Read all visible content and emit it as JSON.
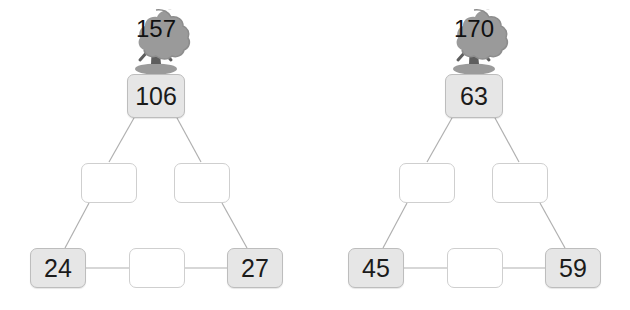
{
  "background_color": "#ffffff",
  "colors": {
    "filled_box_fill": "#e6e6e6",
    "empty_box_fill": "#ffffff",
    "box_border": "#c9c9c9",
    "connector_line": "#b0b0b0",
    "tree_canopy": "#9a9a9a",
    "tree_canopy_shade": "#8d8d8d",
    "tree_trunk": "#5e5e5e",
    "tree_shadow": "#8a8a8a",
    "text": "#1b1b1b"
  },
  "puzzles": [
    {
      "id": "left",
      "tree": {
        "icon": "tree-icon",
        "value": "157"
      },
      "top": {
        "value": "106",
        "filled": true
      },
      "middle": [
        {
          "value": "",
          "filled": false
        },
        {
          "value": "",
          "filled": false
        }
      ],
      "bottom": [
        {
          "value": "24",
          "filled": true
        },
        {
          "value": "",
          "filled": false
        },
        {
          "value": "27",
          "filled": true
        }
      ]
    },
    {
      "id": "right",
      "tree": {
        "icon": "tree-icon",
        "value": "170"
      },
      "top": {
        "value": "63",
        "filled": true
      },
      "middle": [
        {
          "value": "",
          "filled": false
        },
        {
          "value": "",
          "filled": false
        }
      ],
      "bottom": [
        {
          "value": "45",
          "filled": true
        },
        {
          "value": "",
          "filled": false
        },
        {
          "value": "59",
          "filled": true
        }
      ]
    }
  ]
}
